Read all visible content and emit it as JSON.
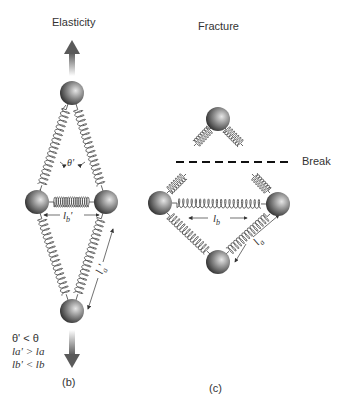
{
  "panels": {
    "elasticity": {
      "title": "Elasticity",
      "caption": "(b)",
      "angle_label": "θ'",
      "lb_label": "l",
      "lb_sub": "b",
      "lb_prime": "'",
      "la_label": "l",
      "la_sub": "a",
      "la_prime": "'",
      "conditions": [
        {
          "lhs": "θ'",
          "op": "<",
          "rhs": "θ"
        },
        {
          "lhs": "la'",
          "op": ">",
          "rhs": "la"
        },
        {
          "lhs": "lb'",
          "op": "<",
          "rhs": "lb"
        }
      ],
      "cond_text": [
        "θ' < θ",
        "la' > la",
        "lb' < lb"
      ]
    },
    "fracture": {
      "title": "Fracture",
      "caption": "(c)",
      "break_label": "Break",
      "lb_label": "l",
      "lb_sub": "b",
      "la_label": "l",
      "la_sub": "a"
    }
  },
  "colors": {
    "ball_light": "#d8d8d8",
    "ball_dark": "#2a2a2a",
    "spring": "#555555",
    "arrow": "#666666",
    "text": "#333333"
  }
}
